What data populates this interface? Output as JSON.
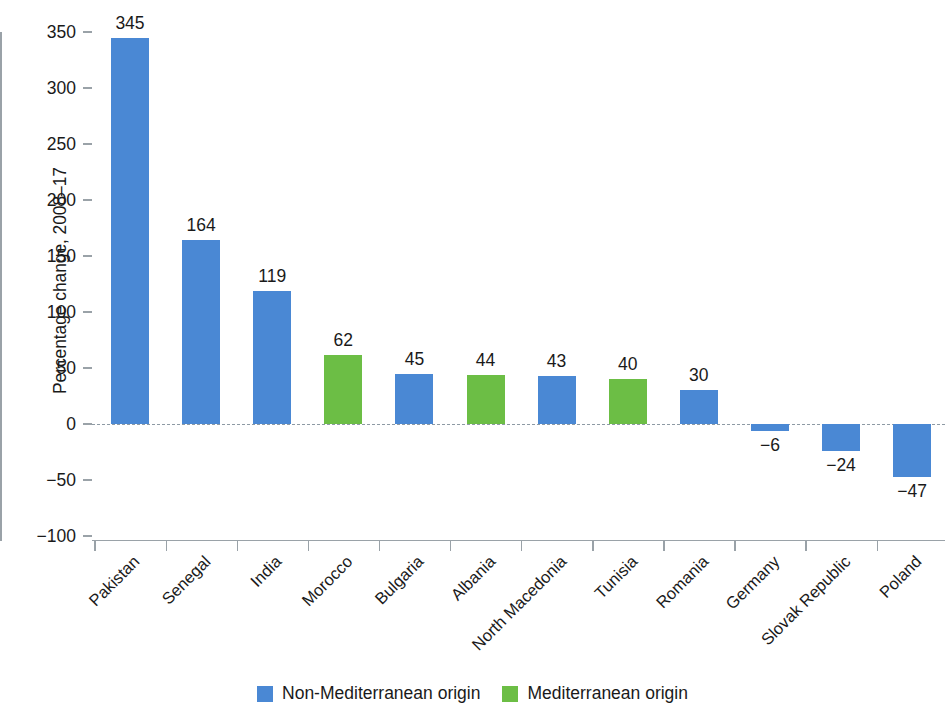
{
  "chart_data": {
    "type": "bar",
    "title": "",
    "subtitle": "",
    "xlabel": "",
    "ylabel": "Percentage change, 2008–17",
    "ylim": [
      -100,
      350
    ],
    "ytick_step": 50,
    "ytick_labels": [
      "350",
      "300",
      "250",
      "200",
      "150",
      "100",
      "50",
      "0",
      "−50",
      "−100"
    ],
    "ytick_values": [
      350,
      300,
      250,
      200,
      150,
      100,
      50,
      0,
      -50,
      -100
    ],
    "grid": false,
    "zero_line": true,
    "legend_position": "bottom-center",
    "categories": [
      "Pakistan",
      "Senegal",
      "India",
      "Morocco",
      "Bulgaria",
      "Albania",
      "North Macedonia",
      "Tunisia",
      "Romania",
      "Germany",
      "Slovak Republic",
      "Poland"
    ],
    "values": [
      345,
      164,
      119,
      62,
      45,
      44,
      43,
      40,
      30,
      -6,
      -24,
      -47
    ],
    "value_labels": [
      "345",
      "164",
      "119",
      "62",
      "45",
      "44",
      "43",
      "40",
      "30",
      "−6",
      "−24",
      "−47"
    ],
    "groups": [
      "non-mediterranean",
      "non-mediterranean",
      "non-mediterranean",
      "mediterranean",
      "non-mediterranean",
      "mediterranean",
      "non-mediterranean",
      "mediterranean",
      "non-mediterranean",
      "non-mediterranean",
      "non-mediterranean",
      "non-mediterranean"
    ],
    "series": [
      {
        "name": "Non-Mediterranean origin",
        "color": "#4a88d4",
        "points": [
          {
            "category": "Pakistan",
            "value": 345
          },
          {
            "category": "Senegal",
            "value": 164
          },
          {
            "category": "India",
            "value": 119
          },
          {
            "category": "Bulgaria",
            "value": 45
          },
          {
            "category": "North Macedonia",
            "value": 43
          },
          {
            "category": "Romania",
            "value": 30
          },
          {
            "category": "Germany",
            "value": -6
          },
          {
            "category": "Slovak Republic",
            "value": -24
          },
          {
            "category": "Poland",
            "value": -47
          }
        ]
      },
      {
        "name": "Mediterranean origin",
        "color": "#6cbe45",
        "points": [
          {
            "category": "Morocco",
            "value": 62
          },
          {
            "category": "Albania",
            "value": 44
          },
          {
            "category": "Tunisia",
            "value": 40
          }
        ]
      }
    ],
    "legend": [
      {
        "label": "Non-Mediterranean origin",
        "color": "#4a88d4",
        "key": "non-mediterranean"
      },
      {
        "label": "Mediterranean origin",
        "color": "#6cbe45",
        "key": "mediterranean"
      }
    ]
  },
  "colors": {
    "non_mediterranean": "#4a88d4",
    "mediterranean": "#6cbe45",
    "axis": "#9aa2a8",
    "text": "#1a1a1a",
    "background": "#ffffff"
  }
}
